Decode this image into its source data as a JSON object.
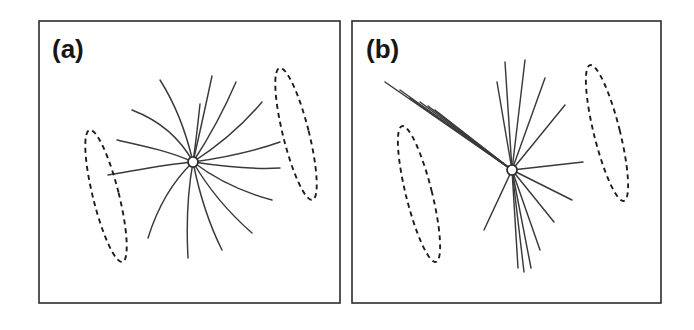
{
  "figure": {
    "width": 694,
    "height": 330,
    "background_color": "#ffffff",
    "line_color": "#3a3a3a",
    "frame_color": "#2b2b2b",
    "dash_color": "#1d1d1d",
    "hub_fill_color": "#ffffff"
  },
  "panels": [
    {
      "id": "panel-a",
      "label": "(a)",
      "label_x": 52,
      "label_y": 58,
      "frame": {
        "x": 39,
        "y": 21,
        "width": 301,
        "height": 282
      },
      "hub": {
        "cx": 193,
        "cy": 162,
        "r": 5.0
      },
      "description": "curved trajectories radiating from central hub",
      "trajectory_style": "curved",
      "trajectory_count": 15,
      "trajectories": [
        "M193,162 C186,132 176,105 160,80",
        "M193,162 C180,138 158,120 132,110",
        "M193,162 C172,152 144,146 117,140",
        "M193,162 C168,164 138,170 108,175",
        "M193,162 C174,180 158,206 148,238",
        "M193,162 C188,190 186,222 188,258",
        "M193,162 C199,192 208,222 222,250",
        "M193,162 C208,188 228,212 252,233",
        "M193,162 C214,178 242,192 272,200",
        "M193,162 C220,166 250,170 280,168",
        "M193,162 C222,158 252,152 280,142",
        "M193,162 C218,146 242,126 262,102",
        "M193,162 C210,136 224,110 236,82",
        "M193,162 C200,132 206,104 212,76",
        "M193,162 C196,142 198,122 200,104"
      ],
      "ellipses": [
        {
          "cx": 106,
          "cy": 196,
          "rx": 13,
          "ry": 68,
          "rotation": -14,
          "name": "left-focus-ellipse"
        },
        {
          "cx": 296,
          "cy": 134,
          "rx": 13,
          "ry": 68,
          "rotation": -14,
          "name": "right-focus-ellipse"
        }
      ]
    },
    {
      "id": "panel-b",
      "label": "(b)",
      "label_x": 366,
      "label_y": 58,
      "frame": {
        "x": 352,
        "y": 21,
        "width": 309,
        "height": 282
      },
      "hub": {
        "cx": 512,
        "cy": 170,
        "r": 5.0
      },
      "description": "straight rays radiating from central hub with bundled groups",
      "trajectory_style": "straight",
      "trajectory_count": 16,
      "trajectories": [
        "M512,170 L385,82",
        "M512,170 L400,90",
        "M512,170 L410,98",
        "M512,170 L420,102",
        "M512,170 L428,106",
        "M512,170 L435,110",
        "M512,170 L497,82",
        "M512,170 L505,62",
        "M512,170 L525,60",
        "M512,170 L545,78",
        "M512,170 L565,105",
        "M512,170 L583,162",
        "M512,170 L572,200",
        "M512,170 L554,222",
        "M512,170 L540,250",
        "M512,170 L531,268",
        "M512,170 L524,272",
        "M512,170 L518,268",
        "M512,170 L484,230"
      ],
      "ellipses": [
        {
          "cx": 419,
          "cy": 194,
          "rx": 13,
          "ry": 70,
          "rotation": -14,
          "name": "left-focus-ellipse"
        },
        {
          "cx": 607,
          "cy": 133,
          "rx": 13,
          "ry": 70,
          "rotation": -14,
          "name": "right-focus-ellipse"
        }
      ]
    }
  ]
}
